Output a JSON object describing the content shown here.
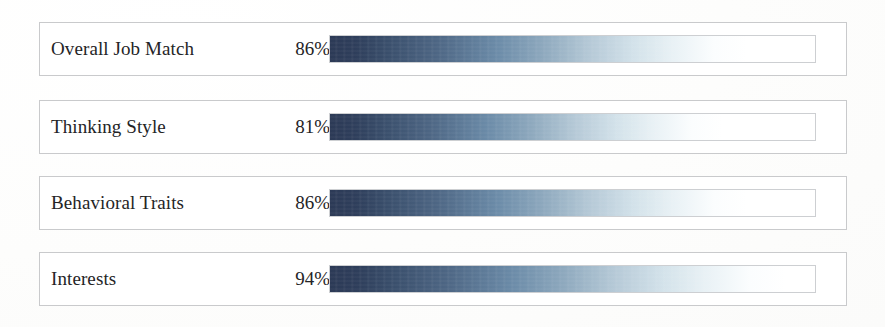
{
  "panel": {
    "background_color": "#ffffff",
    "row_border_color": "#c9cacc",
    "meter_outline_color": "#cdcfd2",
    "text_color": "#242426"
  },
  "chart_data": {
    "type": "bar",
    "title": "",
    "subtitle": "",
    "xlabel": "",
    "ylabel": "",
    "orientation": "horizontal",
    "grid": false,
    "legend": false,
    "legend_position": "none",
    "value_unit": "%",
    "xlim": [
      0,
      100
    ],
    "categories": [
      "Overall Job Match",
      "Thinking Style",
      "Behavioral Traits",
      "Interests"
    ],
    "values": [
      86,
      81,
      86,
      94
    ],
    "value_labels": [
      "86%",
      "81%",
      "86%",
      "94%"
    ],
    "bar_gradient": {
      "direction": "left-to-right",
      "stops": [
        "#2c3a56",
        "#3a4f6c",
        "#6b8ba8",
        "#8da8bd",
        "#b4c8d6",
        "#d3e2ea",
        "#ffffff"
      ]
    },
    "rows": [
      {
        "label": "Overall Job Match",
        "value": 86,
        "value_label": "86%",
        "fill_percent": 86
      },
      {
        "label": "Thinking Style",
        "value": 81,
        "value_label": "81%",
        "fill_percent": 81
      },
      {
        "label": "Behavioral Traits",
        "value": 86,
        "value_label": "86%",
        "fill_percent": 86
      },
      {
        "label": "Interests",
        "value": 94,
        "value_label": "94%",
        "fill_percent": 94
      }
    ]
  }
}
